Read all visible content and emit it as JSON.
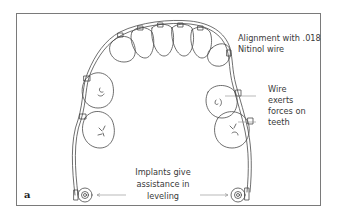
{
  "figure": {
    "panel_letter": "a",
    "annotations": {
      "alignment": {
        "line1": "Alignment with .018",
        "line2": "Nitinol wire"
      },
      "wire_forces": {
        "line1": "Wire",
        "line2": "exerts",
        "line3": "forces on",
        "line4": "teeth"
      },
      "implants": {
        "line1": "Implants give",
        "line2": "assistance in",
        "line3": "leveling"
      }
    },
    "colors": {
      "line": "#4a4a4a",
      "frame": "#7a7a7a",
      "text": "#3a3a3a"
    }
  }
}
